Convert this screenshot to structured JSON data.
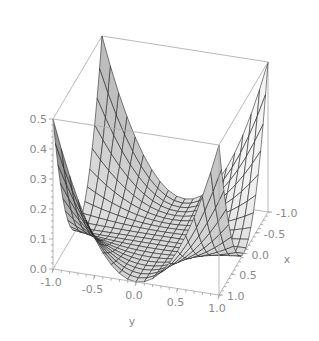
{
  "chart_data": {
    "type": "surface3d",
    "title": "",
    "function": "z = 0.5 * x^2 * y^2",
    "xlabel": "x",
    "ylabel": "y",
    "zlabel": "",
    "x_range": [
      -1.0,
      1.0
    ],
    "y_range": [
      -1.0,
      1.0
    ],
    "z_range": [
      0.0,
      0.5
    ],
    "x_ticks": [
      "-1.0",
      "-0.5",
      "0.0",
      "0.5",
      "1.0"
    ],
    "y_ticks": [
      "-1.0",
      "-0.5",
      "0.0",
      "0.5",
      "1.0"
    ],
    "z_ticks": [
      "0.0",
      "0.1",
      "0.2",
      "0.3",
      "0.4",
      "0.5"
    ],
    "grid_lines": 20,
    "surface_color": "#c8c8c8",
    "mesh_color": "#1a1a1a",
    "box_color": "#b0b0b0",
    "label_color": "#8a8a8a"
  },
  "axes": {
    "x_label": "x",
    "y_label": "y"
  }
}
